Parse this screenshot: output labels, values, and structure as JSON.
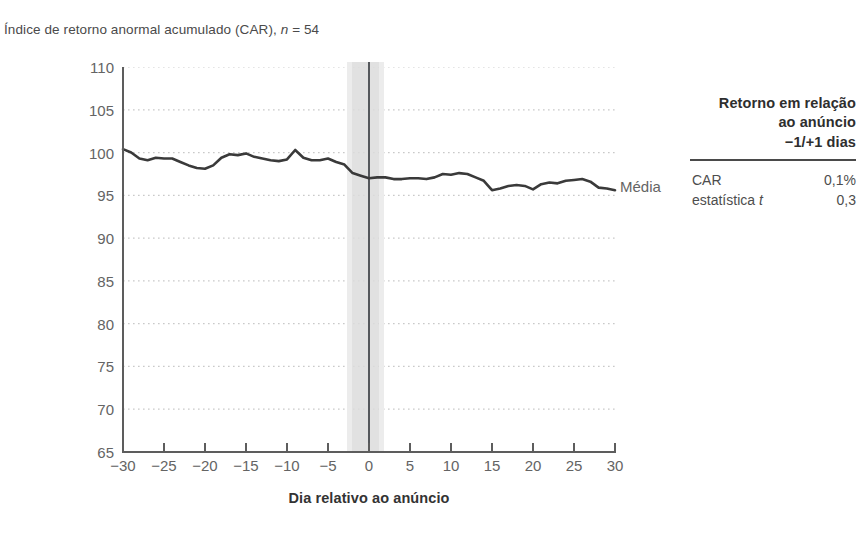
{
  "title_prefix": "Índice de retorno anormal acumulado (CAR), ",
  "title_n_italic": "n",
  "title_n_value": " = 54",
  "series_label": "Média",
  "axis": {
    "x_title": "Dia relativo ao anúncio",
    "y_ticks": [
      110,
      105,
      100,
      95,
      90,
      85,
      80,
      75,
      70,
      65
    ],
    "x_ticks": [
      "−30",
      "−25",
      "−20",
      "−15",
      "−10",
      "−5",
      "0",
      "5",
      "10",
      "15",
      "20",
      "25",
      "30"
    ]
  },
  "side_table": {
    "header_line1": "Retorno em relação",
    "header_line2": "ao anúncio",
    "header_line3": "−1/+1 dias",
    "rows": [
      {
        "label": "CAR",
        "label_italic": "",
        "value": "0,1%"
      },
      {
        "label": "estatística ",
        "label_italic": "t",
        "value": "0,3"
      }
    ]
  },
  "colors": {
    "line": "#3a3a3a",
    "grid": "#c9c9c9",
    "band": "#dcdcdc",
    "event_line": "#55585c",
    "axis": "#5d5d5d",
    "text": "#4d4d4d"
  },
  "chart_data": {
    "type": "line",
    "title": "Índice de retorno anormal acumulado (CAR), n = 54",
    "xlabel": "Dia relativo ao anúncio",
    "ylabel": "",
    "xlim": [
      -30,
      30
    ],
    "ylim": [
      65,
      110
    ],
    "grid": true,
    "legend_position": "right-of-line-end",
    "annotations": [
      {
        "type": "vertical-band",
        "x_from": -1,
        "x_to": 1,
        "label": "−1/+1 dias"
      },
      {
        "type": "vertical-line",
        "x": 0,
        "label": "dia do anúncio"
      }
    ],
    "series": [
      {
        "name": "Média",
        "x": [
          -30,
          -29,
          -28,
          -27,
          -26,
          -25,
          -24,
          -23,
          -22,
          -21,
          -20,
          -19,
          -18,
          -17,
          -16,
          -15,
          -14,
          -13,
          -12,
          -11,
          -10,
          -9,
          -8,
          -7,
          -6,
          -5,
          -4,
          -3,
          -2,
          -1,
          0,
          1,
          2,
          3,
          4,
          5,
          6,
          7,
          8,
          9,
          10,
          11,
          12,
          13,
          14,
          15,
          16,
          17,
          18,
          19,
          20,
          21,
          22,
          23,
          24,
          25,
          26,
          27,
          28,
          29,
          30
        ],
        "values": [
          100.4,
          100.0,
          99.3,
          99.1,
          99.4,
          99.3,
          99.3,
          98.9,
          98.5,
          98.2,
          98.1,
          98.5,
          99.4,
          99.8,
          99.7,
          99.9,
          99.5,
          99.3,
          99.1,
          99.0,
          99.2,
          100.3,
          99.4,
          99.1,
          99.1,
          99.3,
          98.9,
          98.6,
          97.6,
          97.3,
          97.0,
          97.1,
          97.1,
          96.9,
          96.9,
          97.0,
          97.0,
          96.9,
          97.1,
          97.5,
          97.4,
          97.6,
          97.5,
          97.1,
          96.7,
          95.6,
          95.8,
          96.1,
          96.2,
          96.1,
          95.7,
          96.3,
          96.5,
          96.4,
          96.7,
          96.8,
          96.9,
          96.6,
          95.9,
          95.8,
          95.6
        ]
      }
    ]
  }
}
